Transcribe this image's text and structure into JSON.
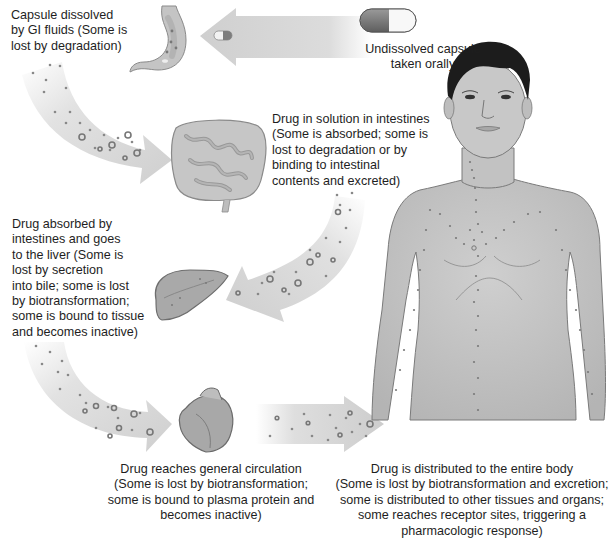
{
  "diagram": {
    "steps": [
      {
        "id": "capsule",
        "text": "Undissolved capsule\ntaken orally",
        "icon": "capsule-icon"
      },
      {
        "id": "stomach",
        "text": "Capsule dissolved\nby GI fluids (Some is\nlost by degradation)",
        "icon": "stomach-icon"
      },
      {
        "id": "intestines",
        "text": "Drug in solution in intestines\n(Some is absorbed; some is\nlost to degradation or by\nbinding to intestinal\ncontents and excreted)",
        "icon": "intestines-icon"
      },
      {
        "id": "liver",
        "text": "Drug absorbed by\nintestines and goes\nto the liver (Some is\nlost by secretion\ninto bile; some is lost\nby biotransformation;\nsome is bound to tissue\nand becomes inactive)",
        "icon": "liver-icon"
      },
      {
        "id": "circulation",
        "text": "Drug reaches general circulation\n(Some is lost by biotransformation;\nsome is bound to plasma protein and\nbecomes inactive)",
        "icon": "heart-icon"
      },
      {
        "id": "body",
        "text": "Drug is distributed to the entire body\n(Some is lost by biotransformation and excretion;\nsome is distributed to other tissues and organs;\nsome reaches receptor sites, triggering a\npharmacologic response)",
        "icon": "human-body-icon"
      }
    ],
    "colors": {
      "arrow": "#d6d6d6",
      "particle": "#8a8a8a",
      "skin": "#c9c9c9",
      "hair": "#1c1c1c",
      "capsule_dark": "#7a7a7a",
      "capsule_light": "#f4f4f4"
    }
  }
}
